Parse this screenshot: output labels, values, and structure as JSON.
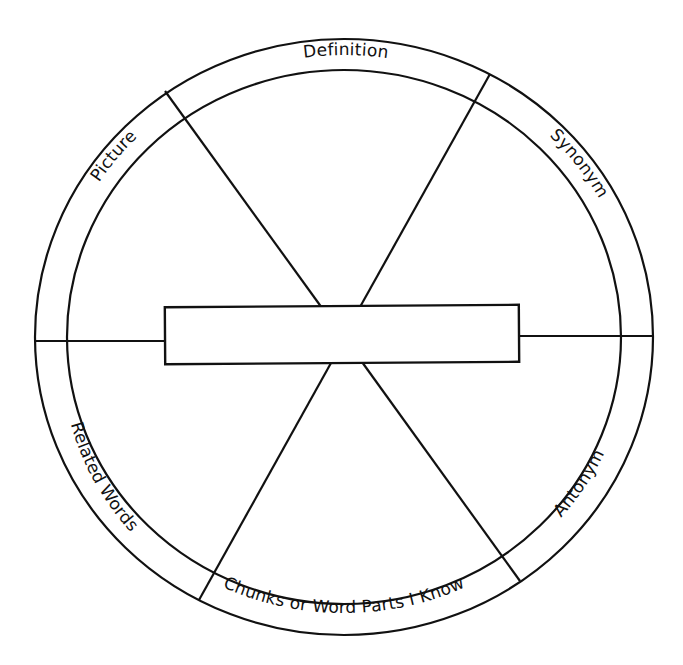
{
  "diagram": {
    "type": "vocabulary-word-wheel",
    "segments": {
      "top": "Definition",
      "top_right": "Synonym",
      "bottom_right": "Antonym",
      "bottom": "Chunks or Word Parts I Know",
      "bottom_left": "Related Words",
      "top_left": "Picture"
    },
    "center_box": {
      "value": ""
    },
    "colors": {
      "line": "#111111",
      "background": "#ffffff"
    }
  }
}
